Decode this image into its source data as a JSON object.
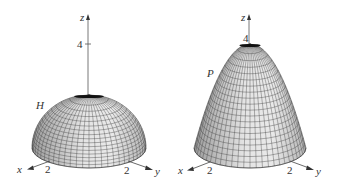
{
  "figure": {
    "background": "#ffffff",
    "surface_fill": "#d9d9d9",
    "surface_fill_light": "#efefef",
    "mesh_color": "#3a3a3a",
    "axis_color": "#444444"
  },
  "panels": [
    {
      "id": "hemisphere",
      "surface_label": "H",
      "description": "upper hemisphere of radius 2",
      "axes": {
        "x_label": "x",
        "y_label": "y",
        "z_label": "z",
        "x_tick": "2",
        "y_tick": "2",
        "z_tick": "4"
      }
    },
    {
      "id": "paraboloid",
      "surface_label": "P",
      "description": "paraboloid z = 4 - x^2 - y^2",
      "axes": {
        "x_label": "x",
        "y_label": "y",
        "z_label": "z",
        "x_tick": "2",
        "y_tick": "2",
        "z_tick": "4"
      }
    }
  ]
}
